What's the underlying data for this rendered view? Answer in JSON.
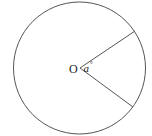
{
  "diagram": {
    "type": "circle-sector",
    "center_label": "O",
    "angle_label": "a",
    "angle_unit_mark": "°",
    "stroke_color": "#555555",
    "circle": {
      "cx": 79.5,
      "cy": 68,
      "r": 66
    },
    "radii_endpoints": [
      {
        "x": 135,
        "y": 31
      },
      {
        "x": 133,
        "y": 107
      }
    ]
  }
}
